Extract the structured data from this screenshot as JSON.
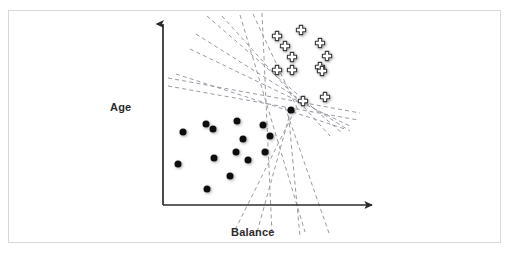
{
  "figure": {
    "type": "scatter-diagram",
    "axes": {
      "y_label": "Age",
      "x_label": "Balance",
      "origin": [
        163,
        205
      ],
      "y_axis_top": [
        163,
        20
      ],
      "x_axis_right": [
        378,
        205
      ],
      "arrow_color": "#2b2b2b"
    },
    "colors": {
      "frame": "#d9d9d9",
      "axis": "#2b2b2b",
      "dot_fill": "#111111",
      "cross_stroke": "#3a3a3a",
      "cross_fill": "#ffffff",
      "dashed_line": "#9a9aa4",
      "background": "#ffffff"
    }
  },
  "chart_data": {
    "type": "scatter",
    "title": "",
    "xlabel": "Balance",
    "ylabel": "Age",
    "grid": false,
    "legend": "none",
    "series": [
      {
        "name": "class-negative",
        "marker": "filled-circle",
        "color": "#111111",
        "points": [
          [
            183,
            132
          ],
          [
            206,
            124
          ],
          [
            213,
            129
          ],
          [
            237,
            121
          ],
          [
            243,
            139
          ],
          [
            263,
            125
          ],
          [
            270,
            136
          ],
          [
            236,
            152
          ],
          [
            214,
            158
          ],
          [
            248,
            160
          ],
          [
            265,
            152
          ],
          [
            178,
            164
          ],
          [
            230,
            176
          ],
          [
            207,
            189
          ],
          [
            291,
            110
          ]
        ]
      },
      {
        "name": "class-positive",
        "marker": "outlined-cross",
        "color": "#3a3a3a",
        "points": [
          [
            277,
            36
          ],
          [
            285,
            46
          ],
          [
            320,
            43
          ],
          [
            292,
            57
          ],
          [
            301,
            30
          ],
          [
            327,
            56
          ],
          [
            277,
            70
          ],
          [
            292,
            70
          ],
          [
            320,
            67
          ],
          [
            322,
            71
          ],
          [
            303,
            101
          ],
          [
            325,
            97
          ]
        ]
      }
    ],
    "decision_boundaries": {
      "style": "dashed",
      "color": "#9a9aa4",
      "count": 14,
      "lines": [
        [
          168,
          78,
          360,
          113
        ],
        [
          168,
          86,
          358,
          120
        ],
        [
          176,
          74,
          345,
          129
        ],
        [
          190,
          49,
          352,
          127
        ],
        [
          196,
          34,
          350,
          131
        ],
        [
          207,
          16,
          342,
          133
        ],
        [
          222,
          16,
          330,
          136
        ],
        [
          253,
          14,
          299,
          112
        ],
        [
          262,
          13,
          272,
          234
        ],
        [
          240,
          15,
          305,
          232
        ],
        [
          285,
          107,
          330,
          236
        ],
        [
          288,
          109,
          300,
          237
        ],
        [
          291,
          110,
          256,
          236
        ],
        [
          295,
          110,
          234,
          232
        ]
      ]
    }
  }
}
